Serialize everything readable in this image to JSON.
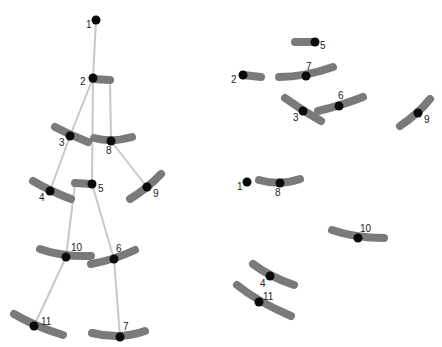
{
  "diagram": {
    "title": "",
    "colors": {
      "bone": "#c8c8c8",
      "bar": "#7a7a7a",
      "joint": "#0a0a0a",
      "label": "#222222",
      "background": "#ffffff"
    },
    "left_skeleton": {
      "nodes": [
        {
          "id": "1",
          "label": "1",
          "x": 96,
          "y": 20,
          "lx": 86,
          "ly": 28,
          "bar": null
        },
        {
          "id": "2",
          "label": "2",
          "x": 93,
          "y": 78,
          "lx": 80,
          "ly": 85,
          "bar": "M93,79 L110,80"
        },
        {
          "id": "3",
          "label": "3",
          "x": 70,
          "y": 136,
          "lx": 59,
          "ly": 146,
          "bar": "M55,127 Q70,135 88,142"
        },
        {
          "id": "8",
          "label": "8",
          "x": 111,
          "y": 141,
          "lx": 106,
          "ly": 154,
          "bar": "M94,138 Q111,143 132,137"
        },
        {
          "id": "5",
          "label": "5",
          "x": 92,
          "y": 184,
          "lx": 98,
          "ly": 192,
          "bar": "M75,183 L92,184"
        },
        {
          "id": "4",
          "label": "4",
          "x": 50,
          "y": 191,
          "lx": 39,
          "ly": 201,
          "bar": "M33,181 Q50,191 71,199"
        },
        {
          "id": "9",
          "label": "9",
          "x": 147,
          "y": 187,
          "lx": 153,
          "ly": 197,
          "bar": "M130,199 Q148,188 161,174"
        },
        {
          "id": "10",
          "label": "10",
          "x": 66,
          "y": 257,
          "lx": 71,
          "ly": 251,
          "bar": "M40,249 Q62,257 91,256"
        },
        {
          "id": "6",
          "label": "6",
          "x": 114,
          "y": 259,
          "lx": 116,
          "ly": 252,
          "bar": "M91,264 Q114,260 135,250"
        },
        {
          "id": "11",
          "label": "11",
          "x": 34,
          "y": 326,
          "lx": 41,
          "ly": 325,
          "bar": "M14,314 Q34,326 63,335"
        },
        {
          "id": "7",
          "label": "7",
          "x": 120,
          "y": 337,
          "lx": 123,
          "ly": 330,
          "bar": "M92,333 Q120,340 145,331"
        }
      ],
      "bones": [
        {
          "from": "1",
          "d": "M96,20 L93,78"
        },
        {
          "from": "2-3",
          "d": "M93,78 L70,136"
        },
        {
          "from": "3-4",
          "d": "M70,136 L50,191"
        },
        {
          "from": "2-5",
          "d": "M93,78 L92,184"
        },
        {
          "from": "2-8",
          "d": "M110,80 L111,141"
        },
        {
          "from": "8-9",
          "d": "M111,141 L147,187"
        },
        {
          "from": "5-10",
          "d": "M75,184 L66,257"
        },
        {
          "from": "5-6",
          "d": "M92,184 L114,259"
        },
        {
          "from": "10-11",
          "d": "M66,257 L34,326"
        },
        {
          "from": "6-7",
          "d": "M114,259 L120,337"
        }
      ]
    },
    "right_scatter": {
      "nodes": [
        {
          "id": "5",
          "label": "5",
          "x": 315,
          "y": 42,
          "lx": 320,
          "ly": 49,
          "bar": "M295,42 L315,42"
        },
        {
          "id": "2",
          "label": "2",
          "x": 243,
          "y": 75,
          "lx": 231,
          "ly": 83,
          "bar": "M243,75 L261,77"
        },
        {
          "id": "7",
          "label": "7",
          "x": 306,
          "y": 76,
          "lx": 306,
          "ly": 70,
          "bar": "M279,77 Q305,77 333,67"
        },
        {
          "id": "3",
          "label": "3",
          "x": 303,
          "y": 111,
          "lx": 293,
          "ly": 121,
          "bar": "M285,98 Q303,111 321,121"
        },
        {
          "id": "6",
          "label": "6",
          "x": 339,
          "y": 106,
          "lx": 338,
          "ly": 99,
          "bar": "M318,111 Q340,106 363,97"
        },
        {
          "id": "9",
          "label": "9",
          "x": 418,
          "y": 113,
          "lx": 424,
          "ly": 123,
          "bar": "M400,126 Q418,114 430,99"
        },
        {
          "id": "1",
          "label": "1",
          "x": 247,
          "y": 182,
          "lx": 237,
          "ly": 190,
          "bar": null
        },
        {
          "id": "8",
          "label": "8",
          "x": 280,
          "y": 183,
          "lx": 275,
          "ly": 196,
          "bar": "M259,180 Q280,186 300,179"
        },
        {
          "id": "10",
          "label": "10",
          "x": 358,
          "y": 238,
          "lx": 360,
          "ly": 232,
          "bar": "M332,230 Q355,238 384,238"
        },
        {
          "id": "4",
          "label": "4",
          "x": 270,
          "y": 276,
          "lx": 260,
          "ly": 287,
          "bar": "M253,264 Q270,277 294,285"
        },
        {
          "id": "11",
          "label": "11",
          "x": 259,
          "y": 302,
          "lx": 263,
          "ly": 300,
          "bar": "M237,285 Q258,302 291,316"
        }
      ]
    }
  }
}
